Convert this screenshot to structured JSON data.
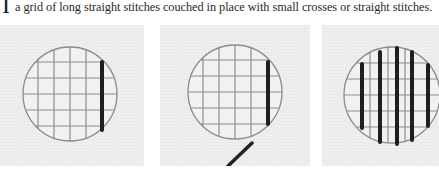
{
  "caption": {
    "dropcap": "I",
    "text": "a grid of long straight stitches couched in place with small crosses or straight stitches."
  },
  "figures": [
    {
      "id": "panel-1",
      "description": "circle with grid of couched stitches, one dark vertical stitch on right"
    },
    {
      "id": "panel-2",
      "description": "circle with grid of couched stitches, one dark vertical stitch on right, thread exiting diagonally at bottom"
    },
    {
      "id": "panel-3",
      "description": "circle with grid covered by five dark vertical straight stitches"
    }
  ],
  "colors": {
    "fabric": "#ededed",
    "grid_thread": "#8a8a8a",
    "dark_thread": "#1e1e1e",
    "text": "#2a2a2a"
  }
}
